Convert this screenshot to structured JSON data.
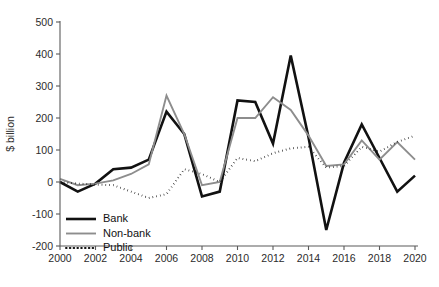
{
  "chart_data": {
    "type": "line",
    "title": "",
    "xlabel": "",
    "ylabel": "$ billion",
    "xlim": [
      2000,
      2020
    ],
    "ylim": [
      -200,
      500
    ],
    "yticks": [
      -200,
      -100,
      0,
      100,
      200,
      300,
      400,
      500
    ],
    "xticks": [
      2000,
      2002,
      2004,
      2006,
      2008,
      2010,
      2012,
      2014,
      2016,
      2018,
      2020
    ],
    "grid": false,
    "legend_position": "bottom-left",
    "x": [
      2000,
      2001,
      2002,
      2003,
      2004,
      2005,
      2006,
      2007,
      2008,
      2009,
      2010,
      2011,
      2012,
      2013,
      2014,
      2015,
      2016,
      2017,
      2018,
      2019,
      2020
    ],
    "series": [
      {
        "name": "Bank",
        "color": "#111111",
        "width": 2.6,
        "dash": "none",
        "values": [
          0,
          -30,
          -5,
          40,
          45,
          70,
          220,
          150,
          -45,
          -30,
          255,
          250,
          120,
          395,
          140,
          -150,
          60,
          180,
          75,
          -30,
          20
        ]
      },
      {
        "name": "Non-bank",
        "color": "#8d8d8d",
        "width": 1.9,
        "dash": "none",
        "values": [
          10,
          -10,
          -5,
          5,
          25,
          55,
          270,
          150,
          -10,
          0,
          200,
          200,
          265,
          225,
          145,
          50,
          55,
          130,
          70,
          125,
          70
        ]
      },
      {
        "name": "Public",
        "color": "#111111",
        "width": 2.0,
        "dash": "dotted",
        "values": [
          0,
          -5,
          -8,
          -10,
          -30,
          -50,
          -38,
          40,
          25,
          0,
          75,
          65,
          90,
          105,
          110,
          45,
          50,
          110,
          95,
          125,
          145
        ]
      }
    ],
    "legend": [
      {
        "label": "Bank",
        "color": "#111111",
        "dash": "none",
        "width": 2.6
      },
      {
        "label": "Non-bank",
        "color": "#8d8d8d",
        "dash": "none",
        "width": 1.9
      },
      {
        "label": "Public",
        "color": "#111111",
        "dash": "dotted",
        "width": 2.0
      }
    ]
  }
}
